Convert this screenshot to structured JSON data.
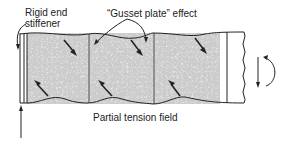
{
  "labels": {
    "rigid_end_stiffener_line1": "Rigid end",
    "rigid_end_stiffener_line2": "stiffener",
    "gusset_plate_effect": "“Gusset plate” effect",
    "partial_tension_field": "Partial tension field"
  },
  "colors": {
    "line": "#222222",
    "shade": "#9a9a9a"
  }
}
